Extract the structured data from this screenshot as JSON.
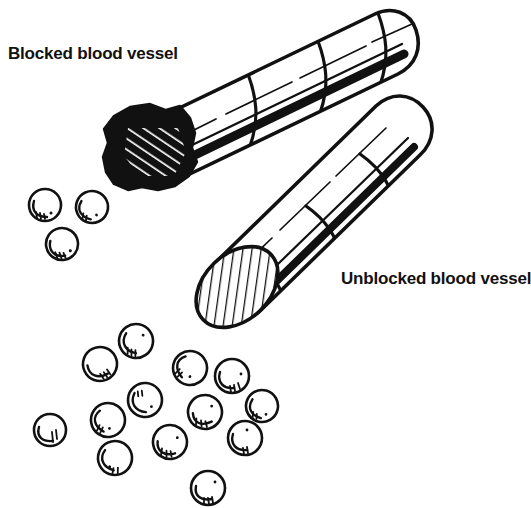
{
  "figure": {
    "background_color": "#ffffff",
    "ink_color": "#111111",
    "width": 531,
    "height": 508
  },
  "labels": {
    "blocked": "Blocked blood vessel",
    "unblocked": "Unblocked blood vessel"
  },
  "vessels": {
    "blocked": {
      "name": "blocked-blood-vessel",
      "description": "Cylindrical tube running diagonally from lower-left to upper-right, drawn in line art with curved segment bands and a thick shaded lower edge; the lower-left opening is occluded by a dark clot.",
      "orientation_degrees": -20,
      "segment_band_count": 4,
      "occlusion": {
        "name": "blood-clot",
        "fill": "#111111",
        "hatching": "white diagonal stripes",
        "lobes": 11
      }
    },
    "unblocked": {
      "name": "unblocked-blood-vessel",
      "description": "Cylindrical tube running diagonally from lower-left to upper-right, open at the lower-left end showing an elliptical hatched lumen cross-section.",
      "orientation_degrees": -38,
      "segment_band_count": 3,
      "opening": {
        "name": "vessel-lumen-opening",
        "shape": "ellipse",
        "hatching": "diagonal line hatch"
      }
    }
  },
  "blood_cells": {
    "name": "blood-cells",
    "description": "Round hand-drawn blood cells with an inner crescent arc and small stipple ticks.",
    "radius": 16,
    "upper_group_count": 3,
    "lower_group_count": 13,
    "total_count": 16,
    "upper_group": [
      {
        "cx": 45,
        "cy": 205,
        "r": 16,
        "rot": 0
      },
      {
        "cx": 92,
        "cy": 207,
        "r": 16,
        "rot": 20
      },
      {
        "cx": 62,
        "cy": 244,
        "r": 16,
        "rot": -10
      }
    ],
    "lower_group": [
      {
        "cx": 136,
        "cy": 341,
        "r": 17,
        "rot": 10
      },
      {
        "cx": 100,
        "cy": 364,
        "r": 17,
        "rot": -25
      },
      {
        "cx": 190,
        "cy": 368,
        "r": 17,
        "rot": 55
      },
      {
        "cx": 232,
        "cy": 376,
        "r": 17,
        "rot": 0
      },
      {
        "cx": 145,
        "cy": 400,
        "r": 17,
        "rot": 5
      },
      {
        "cx": 205,
        "cy": 412,
        "r": 17,
        "rot": -15
      },
      {
        "cx": 108,
        "cy": 420,
        "r": 17,
        "rot": 35
      },
      {
        "cx": 245,
        "cy": 438,
        "r": 17,
        "rot": 0
      },
      {
        "cx": 50,
        "cy": 430,
        "r": 16,
        "rot": 0
      },
      {
        "cx": 170,
        "cy": 442,
        "r": 17,
        "rot": -10
      },
      {
        "cx": 115,
        "cy": 458,
        "r": 17,
        "rot": 20
      },
      {
        "cx": 208,
        "cy": 488,
        "r": 17,
        "rot": 0
      },
      {
        "cx": 262,
        "cy": 406,
        "r": 16,
        "rot": 15
      }
    ]
  }
}
